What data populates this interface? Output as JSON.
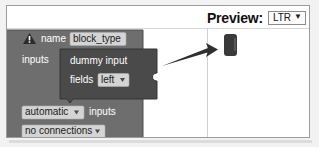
{
  "header": {
    "preview_label": "Preview:",
    "direction_select": {
      "value": "LTR",
      "chevron": "▼",
      "options": [
        "LTR",
        "RTL"
      ]
    }
  },
  "workspace": {
    "factory_block": {
      "warning_icon": "warning-triangle-icon",
      "warning_glyph": "!",
      "rows": [
        {
          "label": "name",
          "field_value": "block_type",
          "field_kind": "text"
        },
        {
          "label": "inputs",
          "field_kind": "statement"
        }
      ],
      "nested_block": {
        "title": "dummy input",
        "field_label": "fields",
        "field_value": "left",
        "field_kind": "dropdown",
        "dropdown_glyph": "▾"
      },
      "bottom_rows": [
        {
          "field_value": "automatic",
          "field_kind": "dropdown",
          "dropdown_glyph": "▾",
          "label": "inputs"
        },
        {
          "field_value": "no connections",
          "field_kind": "dropdown",
          "dropdown_glyph": "▾",
          "label": ""
        }
      ]
    }
  },
  "preview": {
    "block_name": "preview-block",
    "annotation": "pointer-arrow"
  },
  "colors": {
    "block_body": "#6e6e6e",
    "nested_block_body": "#4a4a4a",
    "field_background": "#d4d4d4",
    "field_text": "#1b1b1b",
    "block_text": "#ffffff",
    "preview_block": "#3a3a3a",
    "card_border": "#9b9b9b",
    "page_background": "#f2f2f2"
  }
}
